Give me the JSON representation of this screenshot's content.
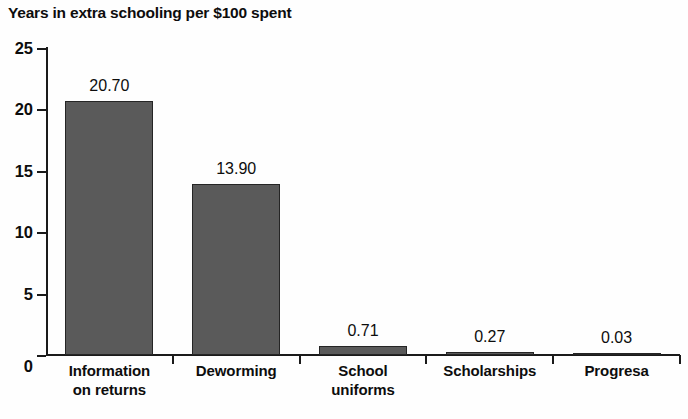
{
  "chart_data": {
    "type": "bar",
    "title": "Years in extra schooling per $100 spent",
    "xlabel": "",
    "ylabel": "",
    "ylim": [
      0,
      25
    ],
    "yticks": [
      0,
      5,
      10,
      15,
      20,
      25
    ],
    "ytick_labels": [
      "0",
      "5",
      "10",
      "15",
      "20",
      "25"
    ],
    "grid": false,
    "legend": "none",
    "categories": [
      "Information\non returns",
      "Deworming",
      "School\nuniforms",
      "Scholarships",
      "Progresa"
    ],
    "category_lines": [
      [
        "Information",
        "on returns"
      ],
      [
        "Deworming"
      ],
      [
        "School",
        "uniforms"
      ],
      [
        "Scholarships"
      ],
      [
        "Progresa"
      ]
    ],
    "values": [
      20.7,
      13.9,
      0.71,
      0.27,
      0.03
    ],
    "value_labels": [
      "20.70",
      "13.90",
      "0.71",
      "0.27",
      "0.03"
    ],
    "bar_color": "#5a5a5a",
    "bar_edge_color": "#252525",
    "axis_color": "#1a1a1a",
    "text_color": "#0d0d0d",
    "background_color": "#fefefe"
  }
}
